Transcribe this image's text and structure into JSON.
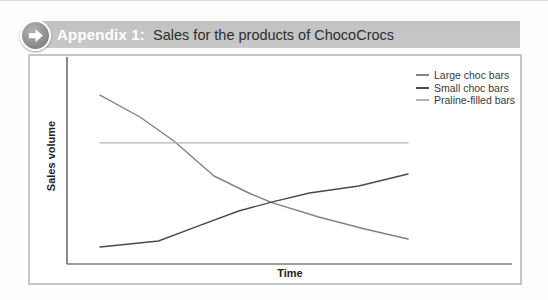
{
  "header": {
    "label": "Appendix 1:",
    "title": "Sales for the products of ChocoCrocs",
    "bar_color": "#c2c2c2",
    "label_color": "#ffffff",
    "title_color": "#2e2e2e",
    "arrow_icon": "arrow-right-in-circle"
  },
  "chart_data": {
    "type": "line",
    "title": "Appendix 1: Sales for the products of ChocoCrocs",
    "xlabel": "Time",
    "ylabel": "Sales volume",
    "x_range": [
      0,
      10
    ],
    "y_range": [
      0,
      100
    ],
    "grid": false,
    "axis_ticks": "none",
    "axis_color": "#3f3f3f",
    "legend_position": "top-right",
    "series": [
      {
        "name": "Large choc bars",
        "color": "#828282",
        "x": [
          0,
          1.3,
          2.4,
          3.7,
          4.9,
          5.6,
          7.1,
          8.6,
          10
        ],
        "y": [
          81.6,
          71.0,
          59.4,
          42.5,
          33.8,
          29.5,
          22.7,
          16.9,
          12.1
        ]
      },
      {
        "name": "Small choc bars",
        "color": "#4a4a4a",
        "x": [
          0,
          1.9,
          3.2,
          4.5,
          5.6,
          6.8,
          8.4,
          10
        ],
        "y": [
          8.2,
          11.1,
          18.4,
          25.6,
          30.0,
          34.3,
          37.7,
          43.5
        ]
      },
      {
        "name": "Praline-filled bars",
        "color": "#b3b3b3",
        "x": [
          0,
          10
        ],
        "y": [
          58.5,
          58.5
        ]
      }
    ]
  }
}
